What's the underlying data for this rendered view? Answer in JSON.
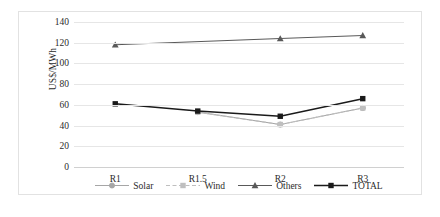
{
  "chart_data": {
    "type": "line",
    "title": "",
    "xlabel": "",
    "ylabel": "US$/MWh",
    "categories": [
      "R1",
      "R1.5",
      "R2",
      "R3"
    ],
    "ylim": [
      0,
      140
    ],
    "ytick_step": 20,
    "yticks": [
      "140",
      "120",
      "100",
      "80",
      "60",
      "40",
      "20",
      "0"
    ],
    "grid": true,
    "legend_position": "bottom",
    "series": [
      {
        "name": "Solar",
        "values": [
          null,
          53,
          41,
          57
        ],
        "color": "#a6a6a6",
        "marker": "circle",
        "dash": "solid"
      },
      {
        "name": "Wind",
        "values": [
          null,
          53,
          41,
          57
        ],
        "color": "#bfbfbf",
        "marker": "square",
        "dash": "dashed"
      },
      {
        "name": "Others",
        "values": [
          118,
          null,
          124,
          127
        ],
        "color": "#595959",
        "marker": "triangle",
        "dash": "solid"
      },
      {
        "name": "TOTAL",
        "values": [
          61,
          54,
          49,
          66
        ],
        "color": "#1a1a1a",
        "marker": "square",
        "dash": "solid"
      }
    ]
  }
}
